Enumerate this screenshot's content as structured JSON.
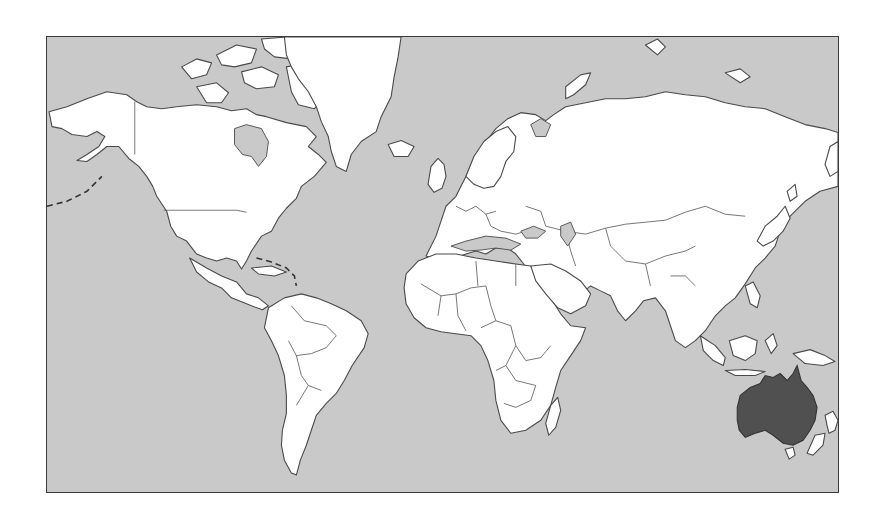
{
  "map": {
    "title": "World map - Australia highlighted",
    "projection": "Mercator",
    "highlighted_region": "Australia",
    "colors": {
      "ocean": "#c9c9c9",
      "land": "#ffffff",
      "highlight": "#505050",
      "border": "#4a4a4a",
      "frame": "#3a3a3a"
    },
    "regions": [
      {
        "name": "North America",
        "highlighted": false
      },
      {
        "name": "Greenland",
        "highlighted": false
      },
      {
        "name": "South America",
        "highlighted": false
      },
      {
        "name": "Europe",
        "highlighted": false
      },
      {
        "name": "Africa",
        "highlighted": false
      },
      {
        "name": "Asia",
        "highlighted": false
      },
      {
        "name": "Australia",
        "highlighted": true
      },
      {
        "name": "New Zealand",
        "highlighted": false
      },
      {
        "name": "Madagascar",
        "highlighted": false
      },
      {
        "name": "Indonesia",
        "highlighted": false
      },
      {
        "name": "Japan",
        "highlighted": false
      },
      {
        "name": "Iceland",
        "highlighted": false
      }
    ]
  }
}
